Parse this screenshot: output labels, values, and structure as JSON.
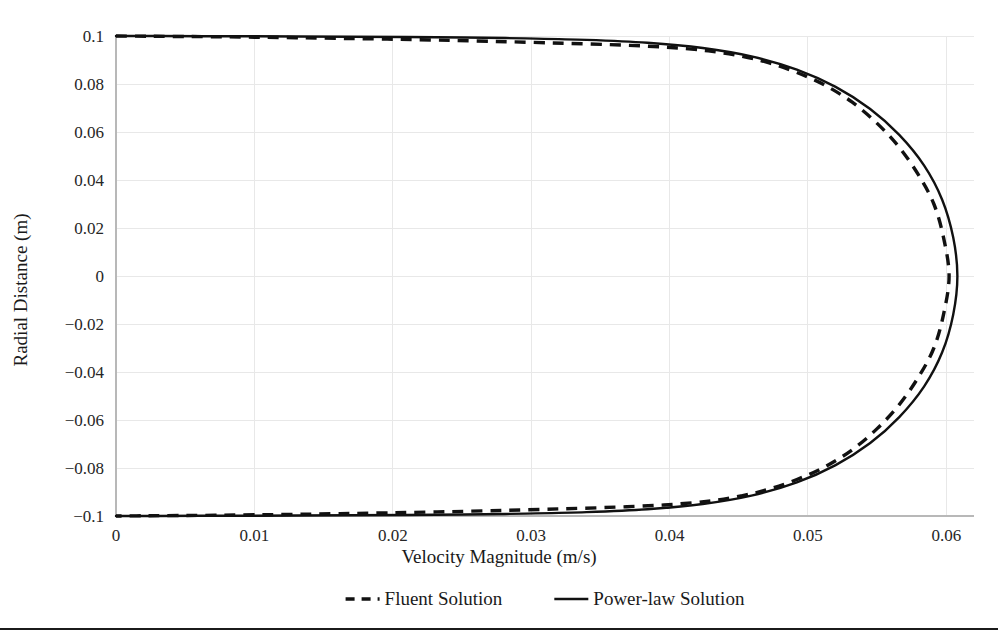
{
  "chart_data": {
    "type": "line",
    "title": "",
    "xlabel": "Velocity Magnitude (m/s)",
    "ylabel": "Radial Distance (m)",
    "xlim": [
      0,
      0.062
    ],
    "ylim": [
      -0.1,
      0.1
    ],
    "grid": true,
    "legend_position": "bottom",
    "xticks": [
      0,
      0.01,
      0.02,
      0.03,
      0.04,
      0.05,
      0.06
    ],
    "xtick_labels": [
      "0",
      "0.01",
      "0.02",
      "0.03",
      "0.04",
      "0.05",
      "0.06"
    ],
    "yticks": [
      0.1,
      0.08,
      0.06,
      0.04,
      0.02,
      0,
      -0.02,
      -0.04,
      -0.06,
      -0.08,
      -0.1
    ],
    "ytick_labels": [
      "0.1",
      "0.08",
      "0.06",
      "0.04",
      "0.02",
      "0",
      "−0.02",
      "−0.04",
      "−0.06",
      "−0.08",
      "−0.1"
    ],
    "series": [
      {
        "name": "Fluent Solution",
        "style": "dashed",
        "color": "#111111",
        "x": [
          0.0,
          0.0022,
          0.0046,
          0.0072,
          0.01,
          0.013,
          0.0162,
          0.0196,
          0.0232,
          0.027,
          0.031,
          0.0352,
          0.0396,
          0.0428,
          0.0452,
          0.0472,
          0.0492,
          0.0512,
          0.0532,
          0.055,
          0.0566,
          0.058,
          0.0591,
          0.0598,
          0.0602,
          0.0598,
          0.0591,
          0.058,
          0.0566,
          0.055,
          0.0532,
          0.0512,
          0.0492,
          0.0472,
          0.0452,
          0.0428,
          0.0396,
          0.0352,
          0.031,
          0.027,
          0.0232,
          0.0196,
          0.0162,
          0.013,
          0.01,
          0.0072,
          0.0046,
          0.0022,
          0.0
        ],
        "y": [
          0.1,
          0.0999,
          0.0998,
          0.0997,
          0.0995,
          0.0993,
          0.099,
          0.0987,
          0.0983,
          0.0978,
          0.0972,
          0.0965,
          0.0954,
          0.0938,
          0.0916,
          0.0888,
          0.0848,
          0.0796,
          0.0724,
          0.0636,
          0.0536,
          0.042,
          0.03,
          0.016,
          0.0,
          -0.016,
          -0.03,
          -0.042,
          -0.0536,
          -0.0636,
          -0.0724,
          -0.0796,
          -0.0848,
          -0.0888,
          -0.0916,
          -0.0938,
          -0.0954,
          -0.0965,
          -0.0972,
          -0.0978,
          -0.0983,
          -0.0987,
          -0.099,
          -0.0993,
          -0.0995,
          -0.0997,
          -0.0998,
          -0.0999,
          -0.1
        ]
      },
      {
        "name": "Power-law Solution",
        "style": "solid",
        "color": "#111111",
        "x": [
          0.0,
          0.003,
          0.0062,
          0.0096,
          0.0132,
          0.017,
          0.021,
          0.0252,
          0.0296,
          0.034,
          0.0384,
          0.0424,
          0.046,
          0.0492,
          0.052,
          0.0545,
          0.0566,
          0.0584,
          0.0597,
          0.0605,
          0.0608,
          0.0605,
          0.0597,
          0.0584,
          0.0566,
          0.0545,
          0.052,
          0.0492,
          0.046,
          0.0424,
          0.0384,
          0.034,
          0.0296,
          0.0252,
          0.021,
          0.017,
          0.0132,
          0.0096,
          0.0062,
          0.003,
          0.0
        ],
        "y": [
          0.1,
          0.1,
          0.0999,
          0.0999,
          0.0998,
          0.0997,
          0.0996,
          0.0994,
          0.099,
          0.0984,
          0.0972,
          0.095,
          0.0914,
          0.086,
          0.0788,
          0.0696,
          0.0588,
          0.046,
          0.0318,
          0.016,
          0.0,
          -0.016,
          -0.0318,
          -0.046,
          -0.0588,
          -0.0696,
          -0.0788,
          -0.086,
          -0.0914,
          -0.095,
          -0.0972,
          -0.0984,
          -0.099,
          -0.0994,
          -0.0996,
          -0.0997,
          -0.0998,
          -0.0999,
          -0.0999,
          -0.1,
          -0.1
        ]
      }
    ],
    "legend": [
      {
        "label": "Fluent Solution",
        "style": "dashed"
      },
      {
        "label": "Power-law Solution",
        "style": "solid"
      }
    ]
  }
}
